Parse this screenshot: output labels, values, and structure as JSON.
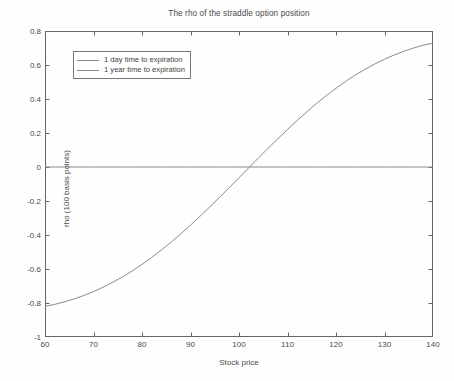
{
  "figure": {
    "title": "The rho of the straddle option position",
    "background_color": "#fefefe"
  },
  "axes": {
    "x_label": "Stock price",
    "y_label": "rho (100 basis points)",
    "x_ticks": [
      "60",
      "70",
      "80",
      "90",
      "100",
      "110",
      "120",
      "130",
      "140"
    ],
    "y_ticks": [
      "0.8",
      "0.6",
      "0.4",
      "0.2",
      "0",
      "-0.2",
      "-0.4",
      "-0.6",
      "-0.8",
      "-1"
    ],
    "axis_color": "#666666"
  },
  "legend": {
    "items": [
      {
        "label": "1 day time to expiration",
        "color": "#8a8a8a"
      },
      {
        "label": "1 year time to expiration",
        "color": "#8a8a8a"
      }
    ]
  },
  "chart_data": {
    "type": "line",
    "title": "The rho of the straddle option position",
    "xlabel": "Stock price",
    "ylabel": "rho (100 basis points)",
    "xlim": [
      60,
      140
    ],
    "ylim": [
      -1,
      0.8
    ],
    "xticks": [
      60,
      70,
      80,
      90,
      100,
      110,
      120,
      130,
      140
    ],
    "yticks": [
      -1,
      -0.8,
      -0.6,
      -0.4,
      -0.2,
      0,
      0.2,
      0.4,
      0.6,
      0.8
    ],
    "grid": false,
    "legend_position": "upper left",
    "x": [
      60,
      62,
      64,
      66,
      68,
      70,
      72,
      74,
      76,
      78,
      80,
      82,
      84,
      86,
      88,
      90,
      92,
      94,
      96,
      98,
      100,
      102,
      104,
      106,
      108,
      110,
      112,
      114,
      116,
      118,
      120,
      122,
      124,
      126,
      128,
      130,
      132,
      134,
      136,
      138,
      140
    ],
    "series": [
      {
        "name": "1 day time to expiration",
        "color": "#8a8a8a",
        "values": [
          0,
          0,
          0,
          0,
          0,
          0,
          0,
          0,
          0,
          0,
          0,
          0,
          0,
          0,
          0,
          0,
          0,
          0,
          0,
          0,
          0,
          0,
          0,
          0,
          0,
          0,
          0,
          0,
          0,
          0,
          0,
          0,
          0,
          0,
          0,
          0,
          0,
          0,
          0,
          0,
          0
        ]
      },
      {
        "name": "1 year time to expiration",
        "color": "#8a8a8a",
        "values": [
          -0.82,
          -0.808,
          -0.793,
          -0.776,
          -0.756,
          -0.733,
          -0.707,
          -0.678,
          -0.646,
          -0.611,
          -0.573,
          -0.532,
          -0.488,
          -0.442,
          -0.393,
          -0.342,
          -0.289,
          -0.234,
          -0.178,
          -0.121,
          -0.063,
          -0.005,
          0.053,
          0.11,
          0.166,
          0.221,
          0.274,
          0.325,
          0.374,
          0.42,
          0.463,
          0.504,
          0.541,
          0.575,
          0.606,
          0.634,
          0.659,
          0.681,
          0.7,
          0.716,
          0.729
        ]
      }
    ]
  }
}
